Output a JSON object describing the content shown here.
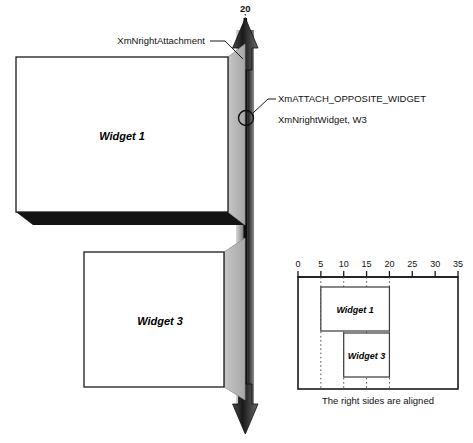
{
  "diagram": {
    "title_value": "20",
    "annotations": [
      {
        "id": "right-attachment",
        "text": "XmNrightAttachment"
      },
      {
        "id": "attach-opposite-widget",
        "text": "XmATTACH_OPPOSITE_WIDGET"
      },
      {
        "id": "right-widget",
        "text": "XmNrightWidget, W3"
      }
    ],
    "widgets": [
      {
        "id": "widget-1",
        "label": "Widget 1"
      },
      {
        "id": "widget-3",
        "label": "Widget 3"
      }
    ],
    "colors": {
      "line": "#1a1a1a",
      "face": "#ffffff",
      "side_face": "#b9b9b9",
      "shadow": "#141414",
      "shaft_light": "#c9c9c9",
      "shaft_dark": "#111111",
      "guide": "#555555"
    }
  },
  "inset": {
    "caption": "The right sides are aligned",
    "axis": {
      "ticks": [
        "0",
        "5",
        "10",
        "15",
        "20",
        "25",
        "30",
        "35"
      ],
      "min": 0,
      "max": 35,
      "step": 5
    },
    "guides": [
      5,
      10,
      15,
      20
    ],
    "bars": [
      {
        "id": "inset-widget-1",
        "label": "Widget 1",
        "start": 5,
        "end": 20
      },
      {
        "id": "inset-widget-3",
        "label": "Widget 3",
        "start": 10,
        "end": 20
      }
    ]
  }
}
